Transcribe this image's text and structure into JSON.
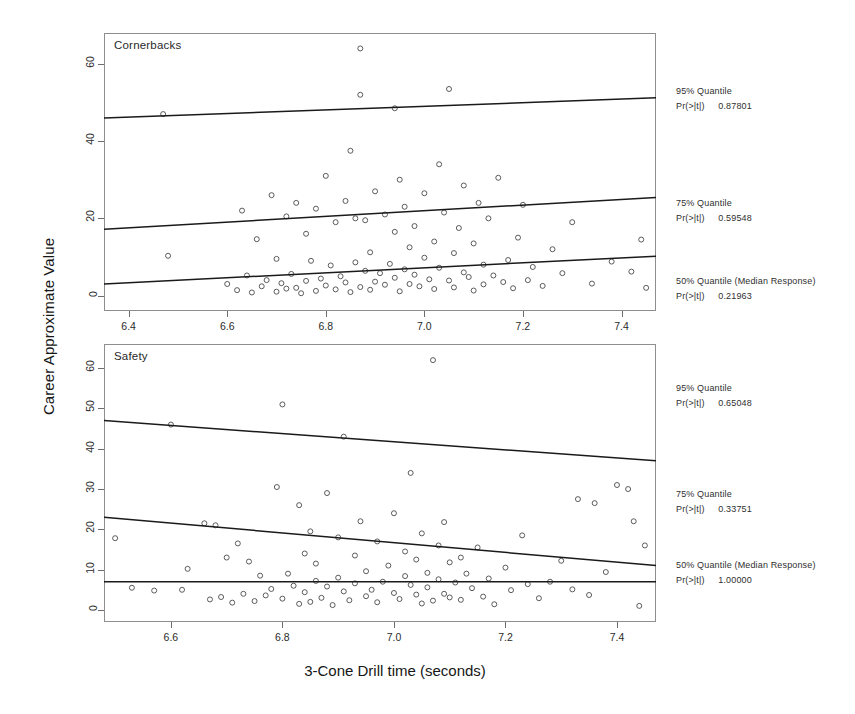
{
  "figure": {
    "xlabel": "3-Cone Drill time (seconds)",
    "ylabel": "Career Approximate Value"
  },
  "chart_data": {
    "type": "scatter",
    "title": "",
    "xlabel": "3-Cone Drill time (seconds)",
    "ylabel": "Career Approximate Value",
    "grid": false,
    "legend": "right-margin annotations",
    "panels": [
      {
        "label": "Cornerbacks",
        "xlim": [
          6.35,
          7.47
        ],
        "ylim": [
          -4,
          68
        ],
        "xticks": [
          "6.4",
          "6.6",
          "6.8",
          "7.0",
          "7.2",
          "7.4"
        ],
        "xtick_values": [
          6.4,
          6.6,
          6.8,
          7.0,
          7.2,
          7.4
        ],
        "yticks": [
          "0",
          "20",
          "40",
          "60"
        ],
        "ytick_values": [
          0,
          20,
          40,
          60
        ],
        "fit_lines": [
          {
            "name": "95% Quantile",
            "x": [
              6.35,
              7.47
            ],
            "y": [
              46.0,
              51.2
            ]
          },
          {
            "name": "75% Quantile",
            "x": [
              6.35,
              7.47
            ],
            "y": [
              17.2,
              25.4
            ]
          },
          {
            "name": "50% Quantile (Median Response)",
            "x": [
              6.35,
              7.47
            ],
            "y": [
              3.0,
              10.2
            ]
          }
        ],
        "annotations": [
          {
            "quantile": "95% Quantile",
            "stat_label": "Pr(>|t|)",
            "p_value": "0.87801"
          },
          {
            "quantile": "75% Quantile",
            "stat_label": "Pr(>|t|)",
            "p_value": "0.59548"
          },
          {
            "quantile": "50% Quantile (Median Response)",
            "stat_label": "Pr(>|t|)",
            "p_value": "0.21963"
          }
        ],
        "points": [
          [
            6.47,
            47.0
          ],
          [
            6.48,
            10.3
          ],
          [
            6.6,
            3.0
          ],
          [
            6.62,
            1.4
          ],
          [
            6.63,
            22.0
          ],
          [
            6.64,
            5.2
          ],
          [
            6.65,
            0.8
          ],
          [
            6.66,
            14.6
          ],
          [
            6.67,
            2.4
          ],
          [
            6.68,
            4.0
          ],
          [
            6.69,
            26.0
          ],
          [
            6.7,
            1.0
          ],
          [
            6.7,
            9.5
          ],
          [
            6.71,
            3.2
          ],
          [
            6.72,
            20.5
          ],
          [
            6.72,
            1.8
          ],
          [
            6.73,
            5.6
          ],
          [
            6.74,
            24.0
          ],
          [
            6.74,
            2.0
          ],
          [
            6.75,
            0.6
          ],
          [
            6.76,
            16.0
          ],
          [
            6.76,
            3.8
          ],
          [
            6.77,
            9.0
          ],
          [
            6.78,
            1.2
          ],
          [
            6.78,
            22.5
          ],
          [
            6.79,
            4.4
          ],
          [
            6.8,
            31.0
          ],
          [
            6.8,
            2.6
          ],
          [
            6.81,
            7.8
          ],
          [
            6.82,
            19.0
          ],
          [
            6.82,
            1.6
          ],
          [
            6.83,
            5.0
          ],
          [
            6.84,
            24.5
          ],
          [
            6.84,
            3.4
          ],
          [
            6.85,
            37.5
          ],
          [
            6.85,
            0.9
          ],
          [
            6.86,
            8.6
          ],
          [
            6.86,
            20.0
          ],
          [
            6.87,
            64.0
          ],
          [
            6.87,
            2.2
          ],
          [
            6.87,
            52.0
          ],
          [
            6.88,
            6.4
          ],
          [
            6.88,
            19.5
          ],
          [
            6.89,
            1.5
          ],
          [
            6.89,
            11.2
          ],
          [
            6.9,
            27.0
          ],
          [
            6.9,
            3.6
          ],
          [
            6.91,
            5.8
          ],
          [
            6.92,
            21.0
          ],
          [
            6.92,
            2.8
          ],
          [
            6.93,
            73.5
          ],
          [
            6.93,
            8.2
          ],
          [
            6.94,
            48.5
          ],
          [
            6.94,
            16.5
          ],
          [
            6.94,
            4.6
          ],
          [
            6.95,
            30.0
          ],
          [
            6.95,
            1.1
          ],
          [
            6.96,
            6.8
          ],
          [
            6.96,
            23.0
          ],
          [
            6.97,
            3.0
          ],
          [
            6.97,
            12.5
          ],
          [
            6.98,
            18.0
          ],
          [
            6.98,
            5.4
          ],
          [
            6.99,
            2.4
          ],
          [
            7.0,
            9.8
          ],
          [
            7.0,
            26.5
          ],
          [
            7.01,
            4.2
          ],
          [
            7.02,
            14.0
          ],
          [
            7.02,
            1.7
          ],
          [
            7.03,
            34.0
          ],
          [
            7.03,
            7.2
          ],
          [
            7.04,
            69.0
          ],
          [
            7.04,
            21.5
          ],
          [
            7.05,
            53.5
          ],
          [
            7.05,
            3.9
          ],
          [
            7.06,
            11.0
          ],
          [
            7.06,
            2.1
          ],
          [
            7.07,
            17.5
          ],
          [
            7.08,
            6.0
          ],
          [
            7.08,
            28.5
          ],
          [
            7.09,
            4.8
          ],
          [
            7.1,
            13.5
          ],
          [
            7.1,
            1.3
          ],
          [
            7.11,
            24.0
          ],
          [
            7.12,
            8.0
          ],
          [
            7.12,
            2.9
          ],
          [
            7.13,
            20.0
          ],
          [
            7.14,
            5.2
          ],
          [
            7.15,
            30.5
          ],
          [
            7.16,
            3.5
          ],
          [
            7.17,
            9.2
          ],
          [
            7.18,
            1.9
          ],
          [
            7.19,
            15.0
          ],
          [
            7.2,
            23.5
          ],
          [
            7.21,
            4.0
          ],
          [
            7.22,
            7.4
          ],
          [
            7.24,
            2.5
          ],
          [
            7.26,
            12.0
          ],
          [
            7.28,
            5.8
          ],
          [
            7.3,
            19.0
          ],
          [
            7.34,
            3.1
          ],
          [
            7.38,
            8.8
          ],
          [
            7.42,
            6.2
          ],
          [
            7.44,
            14.5
          ],
          [
            7.45,
            2.0
          ]
        ]
      },
      {
        "label": "Safety",
        "xlim": [
          6.48,
          7.47
        ],
        "ylim": [
          -3,
          66
        ],
        "xticks": [
          "6.6",
          "6.8",
          "7.0",
          "7.2",
          "7.4"
        ],
        "xtick_values": [
          6.6,
          6.8,
          7.0,
          7.2,
          7.4
        ],
        "yticks": [
          "0",
          "10",
          "20",
          "30",
          "40",
          "50",
          "60"
        ],
        "ytick_values": [
          0,
          10,
          20,
          30,
          40,
          50,
          60
        ],
        "fit_lines": [
          {
            "name": "95% Quantile",
            "x": [
              6.48,
              7.47
            ],
            "y": [
              47.0,
              37.0
            ]
          },
          {
            "name": "75% Quantile",
            "x": [
              6.48,
              7.47
            ],
            "y": [
              23.0,
              11.0
            ]
          },
          {
            "name": "50% Quantile (Median Response)",
            "x": [
              6.48,
              7.47
            ],
            "y": [
              7.0,
              7.0
            ]
          }
        ],
        "annotations": [
          {
            "quantile": "95% Quantile",
            "stat_label": "Pr(>|t|)",
            "p_value": "0.65048"
          },
          {
            "quantile": "75% Quantile",
            "stat_label": "Pr(>|t|)",
            "p_value": "0.33751"
          },
          {
            "quantile": "50% Quantile (Median Response)",
            "stat_label": "Pr(>|t|)",
            "p_value": "1.00000"
          }
        ],
        "points": [
          [
            6.5,
            17.8
          ],
          [
            6.53,
            5.5
          ],
          [
            6.57,
            4.8
          ],
          [
            6.6,
            46.0
          ],
          [
            6.62,
            5.0
          ],
          [
            6.63,
            10.2
          ],
          [
            6.66,
            21.5
          ],
          [
            6.67,
            2.6
          ],
          [
            6.68,
            21.0
          ],
          [
            6.69,
            3.2
          ],
          [
            6.7,
            13.0
          ],
          [
            6.71,
            1.8
          ],
          [
            6.72,
            16.5
          ],
          [
            6.73,
            4.0
          ],
          [
            6.74,
            12.0
          ],
          [
            6.75,
            2.2
          ],
          [
            6.76,
            8.5
          ],
          [
            6.77,
            3.6
          ],
          [
            6.78,
            5.2
          ],
          [
            6.79,
            30.5
          ],
          [
            6.8,
            51.0
          ],
          [
            6.8,
            2.8
          ],
          [
            6.81,
            9.0
          ],
          [
            6.82,
            6.0
          ],
          [
            6.83,
            26.0
          ],
          [
            6.83,
            1.5
          ],
          [
            6.84,
            14.0
          ],
          [
            6.84,
            4.4
          ],
          [
            6.85,
            19.5
          ],
          [
            6.85,
            2.0
          ],
          [
            6.86,
            7.2
          ],
          [
            6.86,
            11.5
          ],
          [
            6.87,
            3.0
          ],
          [
            6.88,
            29.0
          ],
          [
            6.88,
            5.8
          ],
          [
            6.89,
            1.2
          ],
          [
            6.9,
            8.0
          ],
          [
            6.9,
            18.0
          ],
          [
            6.91,
            43.0
          ],
          [
            6.91,
            4.6
          ],
          [
            6.92,
            2.4
          ],
          [
            6.93,
            13.5
          ],
          [
            6.93,
            6.6
          ],
          [
            6.94,
            22.0
          ],
          [
            6.95,
            3.4
          ],
          [
            6.95,
            9.6
          ],
          [
            6.96,
            5.0
          ],
          [
            6.97,
            17.0
          ],
          [
            6.97,
            1.9
          ],
          [
            6.98,
            7.0
          ],
          [
            6.99,
            11.0
          ],
          [
            7.0,
            4.2
          ],
          [
            7.0,
            24.0
          ],
          [
            7.01,
            2.7
          ],
          [
            7.02,
            14.5
          ],
          [
            7.02,
            8.4
          ],
          [
            7.03,
            6.2
          ],
          [
            7.03,
            34.0
          ],
          [
            7.04,
            3.8
          ],
          [
            7.04,
            12.5
          ],
          [
            7.05,
            19.0
          ],
          [
            7.05,
            1.6
          ],
          [
            7.06,
            9.2
          ],
          [
            7.06,
            5.6
          ],
          [
            7.07,
            62.0
          ],
          [
            7.07,
            2.3
          ],
          [
            7.08,
            16.0
          ],
          [
            7.08,
            7.6
          ],
          [
            7.09,
            21.8
          ],
          [
            7.09,
            4.0
          ],
          [
            7.1,
            11.8
          ],
          [
            7.1,
            3.1
          ],
          [
            7.11,
            6.8
          ],
          [
            7.12,
            13.0
          ],
          [
            7.12,
            2.5
          ],
          [
            7.13,
            9.0
          ],
          [
            7.14,
            5.4
          ],
          [
            7.15,
            15.5
          ],
          [
            7.16,
            3.3
          ],
          [
            7.17,
            7.8
          ],
          [
            7.18,
            1.4
          ],
          [
            7.2,
            10.5
          ],
          [
            7.21,
            4.9
          ],
          [
            7.23,
            18.5
          ],
          [
            7.24,
            6.4
          ],
          [
            7.26,
            2.9
          ],
          [
            7.28,
            7.0
          ],
          [
            7.3,
            12.2
          ],
          [
            7.32,
            5.1
          ],
          [
            7.33,
            27.5
          ],
          [
            7.35,
            3.7
          ],
          [
            7.36,
            26.5
          ],
          [
            7.38,
            9.4
          ],
          [
            7.4,
            31.0
          ],
          [
            7.42,
            30.0
          ],
          [
            7.43,
            22.0
          ],
          [
            7.44,
            1.0
          ],
          [
            7.45,
            16.0
          ]
        ]
      }
    ]
  }
}
